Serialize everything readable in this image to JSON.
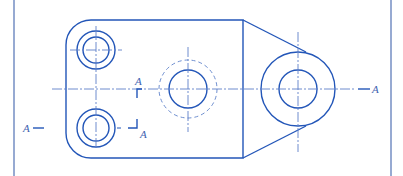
{
  "drawing": {
    "title": "Technical drawing – plan view with section A–A",
    "colors": {
      "line": "#2356b8",
      "frame": "#7d95c7",
      "center": "#5d80c8",
      "hidden": "#6f8fd0",
      "label": "#3f62b0"
    },
    "section_labels": {
      "left": "A",
      "right": "A",
      "mid_top": "A",
      "mid_bottom": "A"
    },
    "features": {
      "body": {
        "left": 66,
        "top": 20,
        "right": 243,
        "bottom": 158,
        "corner_radius": 25
      },
      "upper_hole": {
        "cx": 96,
        "cy": 50,
        "r_outer": 19,
        "r_inner": 13
      },
      "lower_hole": {
        "cx": 96,
        "cy": 128,
        "r_outer": 19,
        "r_inner": 13
      },
      "center_bore": {
        "cx": 188,
        "cy": 89,
        "r_solid": 19,
        "r_hidden": 29
      },
      "lug": {
        "cx": 298,
        "cy": 89,
        "r_outer": 37,
        "r_inner": 19
      }
    }
  }
}
